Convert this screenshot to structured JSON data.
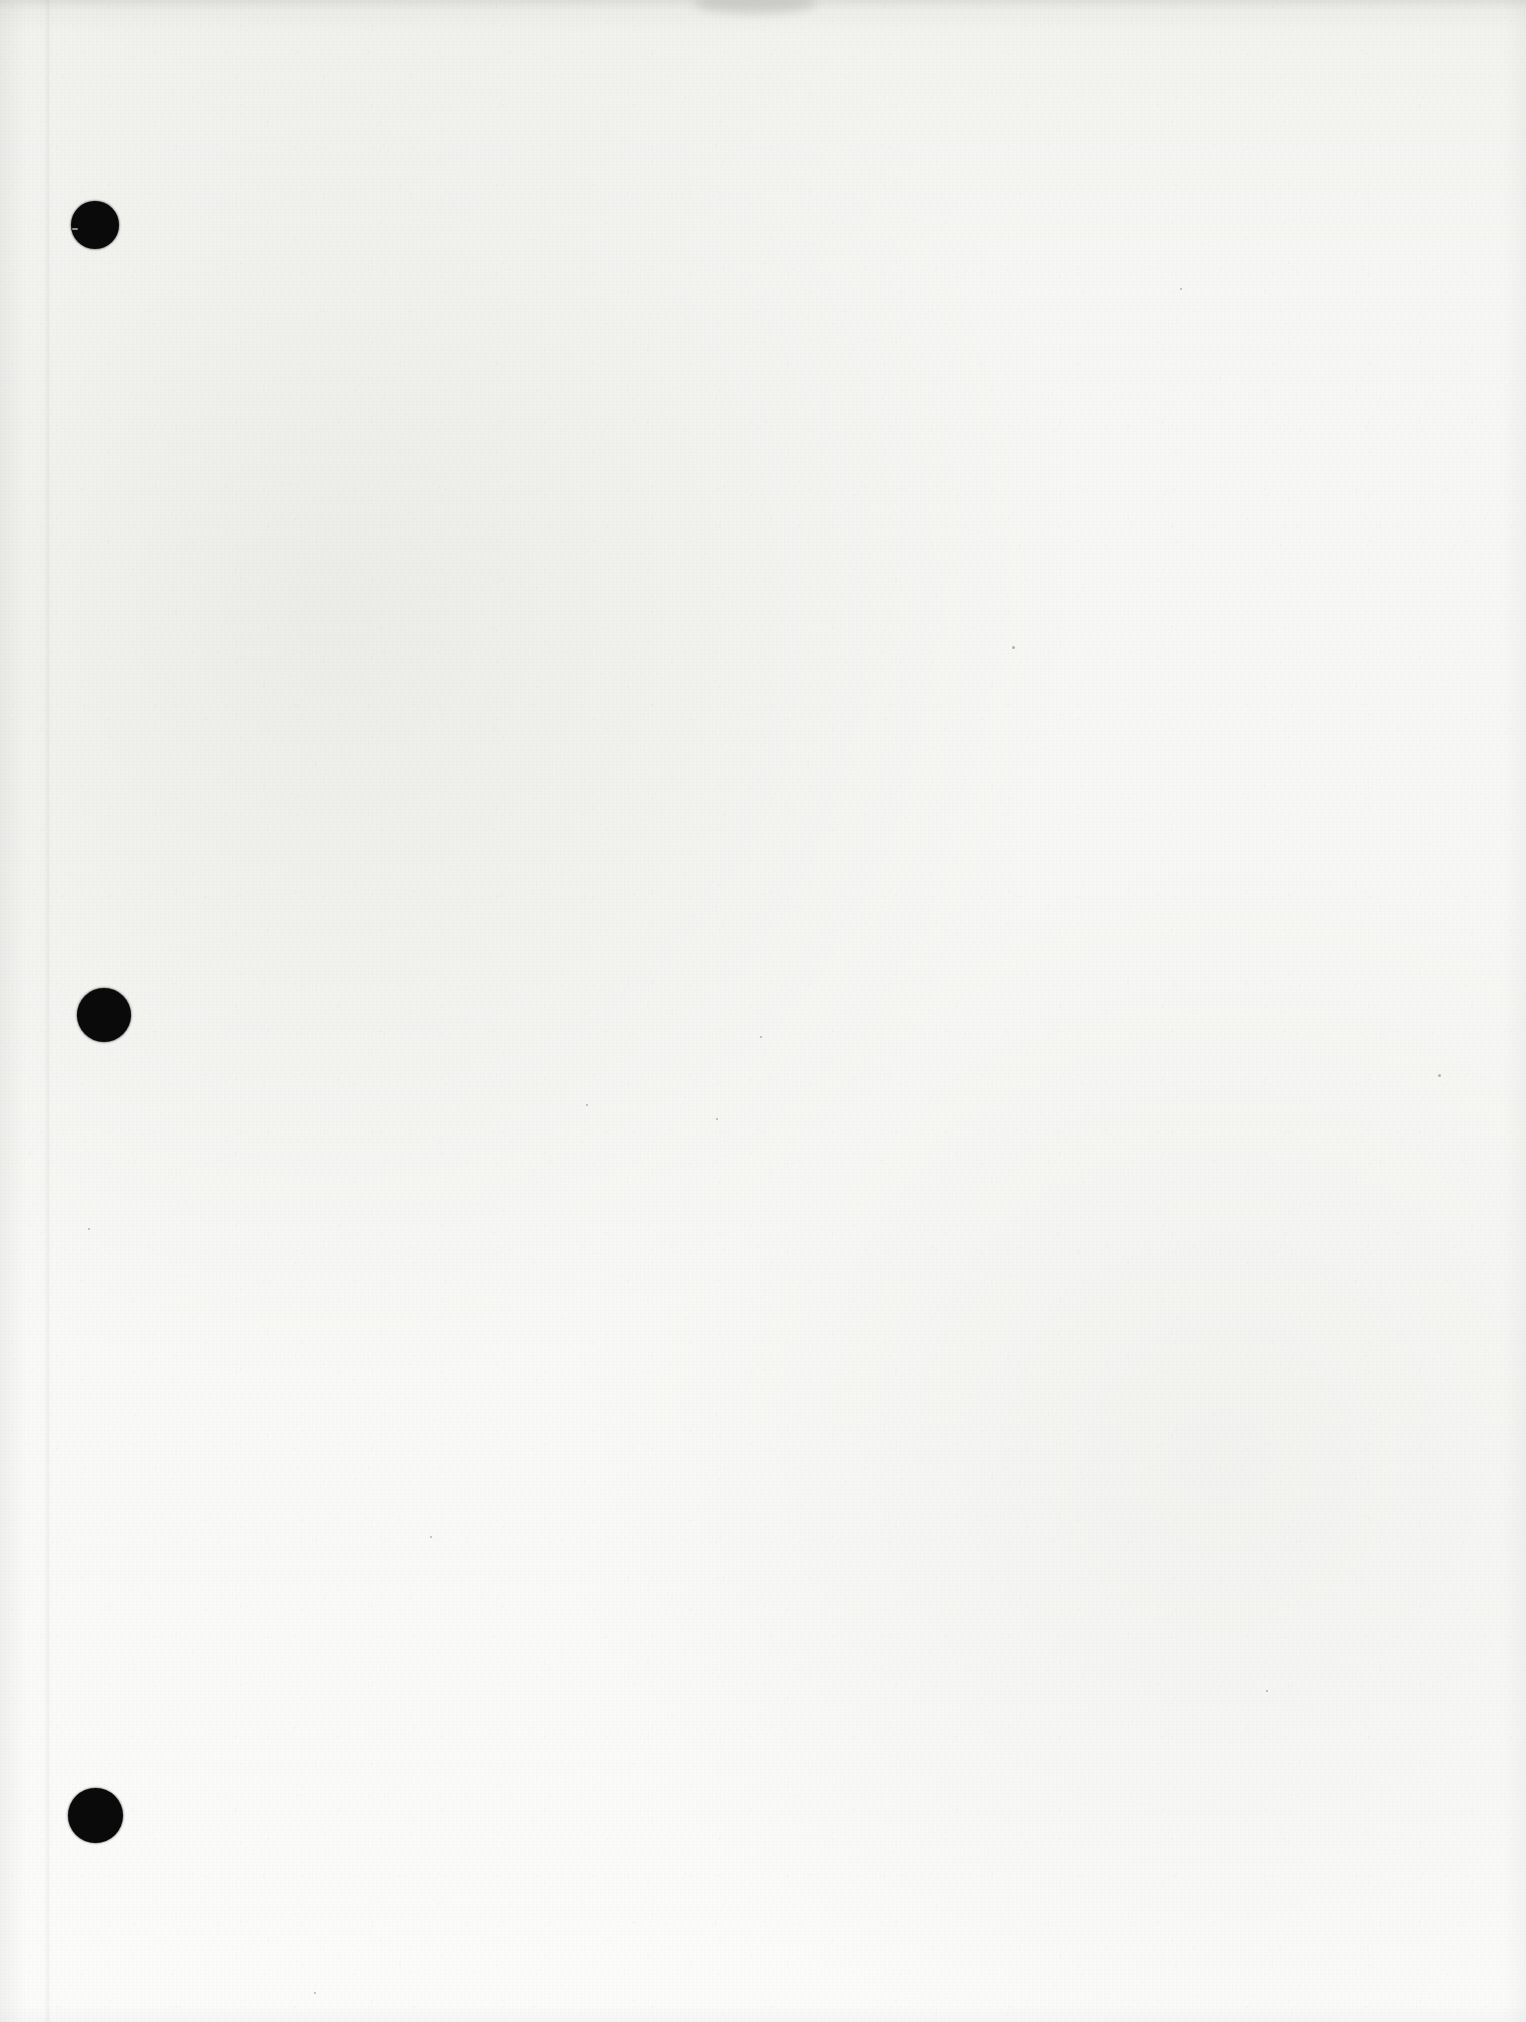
{
  "document": {
    "kind": "scanned-page",
    "title": "Scanned blank page",
    "page_width": 1526,
    "page_height": 2022,
    "orientation": "portrait",
    "content_text": "",
    "has_visible_text": false,
    "notes": "Blank off-white scanned sheet with three black hole-punch marks along the left margin."
  },
  "colors": {
    "paper": "#f7f7f5",
    "paper_top_shadow": "#f2f2ef",
    "paper_bottom": "#fcfcfb",
    "punch_hole": "#0a0a0a",
    "crease": "#e9e9e6",
    "smudge": "#b9b9b7"
  },
  "punch_holes": [
    {
      "label": "top-punch-hole",
      "cx": 95,
      "cy": 225,
      "d": 48,
      "nick": true
    },
    {
      "label": "middle-punch-hole",
      "cx": 104,
      "cy": 1015,
      "d": 54,
      "nick": false
    },
    {
      "label": "bottom-punch-hole",
      "cx": 95,
      "cy": 1815,
      "d": 55,
      "nick": false
    }
  ],
  "artifacts": {
    "crease": {
      "label": "vertical-fold-crease",
      "x": 44,
      "width": 7
    },
    "top_smudge": {
      "label": "top-edge-smudge",
      "x": 694,
      "y": -8,
      "width": 122,
      "height": 22
    },
    "specks": [
      {
        "x": 1012,
        "y": 646,
        "size": 3
      },
      {
        "x": 760,
        "y": 1036,
        "size": 2
      },
      {
        "x": 1438,
        "y": 1074,
        "size": 3
      },
      {
        "x": 586,
        "y": 1104,
        "size": 2
      },
      {
        "x": 1180,
        "y": 288,
        "size": 2
      },
      {
        "x": 430,
        "y": 1536,
        "size": 2
      },
      {
        "x": 88,
        "y": 1228,
        "size": 2
      },
      {
        "x": 1266,
        "y": 1690,
        "size": 2
      },
      {
        "x": 314,
        "y": 1992,
        "size": 2
      },
      {
        "x": 716,
        "y": 1118,
        "size": 2
      }
    ]
  }
}
